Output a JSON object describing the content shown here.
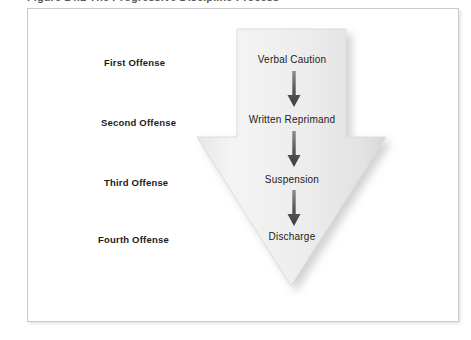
{
  "caption": {
    "text": "Figure 14.1  The Progressive Discipline Process"
  },
  "figure": {
    "title": "Progressive Discipline Process",
    "frame_border_color": "#c9c9c9",
    "background_color": "#ffffff",
    "arrow_fill_color": "#ededed",
    "arrow_edge_color": "#dcdcdc",
    "connector_arrow_color": "#4a4a4a",
    "label_text_color": "#1c1c1c"
  },
  "stages": [
    {
      "label": "First Offense",
      "step": "Verbal Caution"
    },
    {
      "label": "Second Offense",
      "step": "Written Reprimand"
    },
    {
      "label": "Third Offense",
      "step": "Suspension"
    },
    {
      "label": "Fourth Offense",
      "step": "Discharge"
    }
  ],
  "connectors": [
    {
      "name": "arrow-down-icon",
      "from": "Verbal Caution",
      "to": "Written Reprimand"
    },
    {
      "name": "arrow-down-icon",
      "from": "Written Reprimand",
      "to": "Suspension"
    },
    {
      "name": "arrow-down-icon",
      "from": "Suspension",
      "to": "Discharge"
    }
  ]
}
